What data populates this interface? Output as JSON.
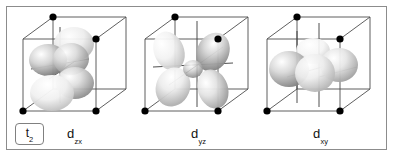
{
  "figure": {
    "type": "d-orbital-diagram",
    "background_color": "#ffffff",
    "frame_border_color": "#8c8c8c",
    "term_symbol": {
      "base": "t",
      "subscript": "2"
    },
    "panels": [
      {
        "id": "panel-1",
        "label_base": "d",
        "label_subscript": "zx",
        "orbital": "d_zx",
        "lobe_count": 4,
        "cube_vertex_dots": 4,
        "description": "cube with four-lobed d orbital oriented in the zx plane"
      },
      {
        "id": "panel-2",
        "label_base": "d",
        "label_subscript": "yz",
        "orbital": "d_yz",
        "lobe_count": 4,
        "cube_vertex_dots": 4,
        "description": "cube with four-lobed d orbital oriented in the yz plane"
      },
      {
        "id": "panel-3",
        "label_base": "d",
        "label_subscript": "xy",
        "orbital": "d_xy",
        "lobe_count": 4,
        "cube_vertex_dots": 4,
        "description": "cube with four-lobed d orbital oriented in the xy plane"
      }
    ],
    "colors": {
      "cube_edge": "#4d4d4d",
      "vertex_dot": "#000000",
      "axis_line": "#3b3b3b",
      "lobe_light": "#f2f2f2",
      "lobe_mid": "#c7c7c7",
      "lobe_dark": "#8f8f8f",
      "label_text": "#111111"
    }
  }
}
